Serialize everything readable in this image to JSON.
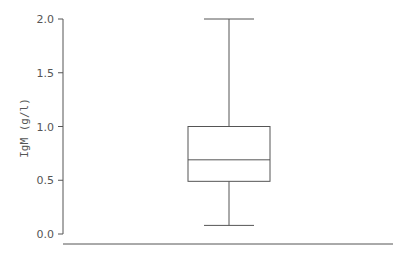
{
  "chart_data": {
    "type": "box",
    "title": "",
    "xlabel": "",
    "ylabel": "IgM (g/l)",
    "ylim": [
      0.0,
      2.0
    ],
    "yticks": [
      0.0,
      0.5,
      1.0,
      1.5,
      2.0
    ],
    "ytick_labels": [
      "0.0",
      "0.5",
      "1.0",
      "1.5",
      "2.0"
    ],
    "grid": false,
    "legend": null,
    "series": [
      {
        "name": "IgM",
        "whisker_low": 0.08,
        "q1": 0.49,
        "median": 0.69,
        "q3": 1.0,
        "whisker_high": 2.0
      }
    ]
  },
  "colors": {
    "line": "#555555",
    "background": "#ffffff"
  }
}
